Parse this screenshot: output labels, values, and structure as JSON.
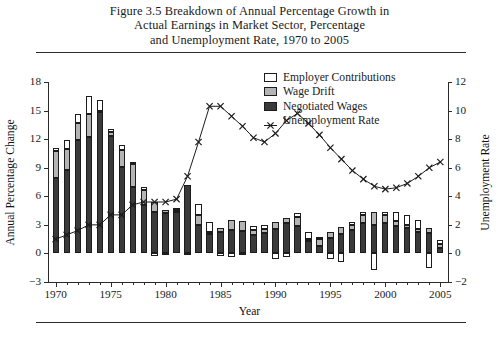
{
  "figure": {
    "caption_lines": [
      "Figure 3.5  Breakdown of Annual Percentage Growth in",
      "Actual Earnings in Market Sector, Percentage",
      "and Unemployment Rate, 1970 to 2005"
    ]
  },
  "legend": {
    "position": "top-right-inside",
    "items": [
      {
        "label": "Employer Contributions",
        "swatch": "white",
        "color": "#ffffff",
        "type": "swatch"
      },
      {
        "label": "Wage Drift",
        "swatch": "light-gray",
        "color": "#b4b4b4",
        "type": "swatch"
      },
      {
        "label": "Negotiated Wages",
        "swatch": "dark-gray",
        "color": "#3a3a3a",
        "type": "swatch"
      },
      {
        "label": "Unemployment Rate",
        "swatch": "x-marker-line",
        "color": "#1c1c1c",
        "type": "line-marker"
      }
    ]
  },
  "axes": {
    "x": {
      "title": "Year",
      "ticks": [
        1970,
        1975,
        1980,
        1985,
        1990,
        1995,
        2000,
        2005
      ],
      "tick_labels": [
        "1970",
        "1975",
        "1980",
        "1985",
        "1990",
        "1995",
        "2000",
        "2005"
      ],
      "min": 1969.3,
      "max": 2005.7
    },
    "y_left": {
      "title": "Annual Percentage Change",
      "ticks": [
        -3,
        0,
        3,
        6,
        9,
        12,
        15,
        18
      ],
      "tick_labels": [
        "−3",
        "0",
        "3",
        "6",
        "9",
        "12",
        "15",
        "18"
      ],
      "min": -3,
      "max": 18
    },
    "y_right": {
      "title": "Unemployment Rate",
      "ticks": [
        -2,
        0,
        2,
        4,
        6,
        8,
        10,
        12
      ],
      "tick_labels": [
        "−2",
        "0",
        "2",
        "4",
        "6",
        "8",
        "10",
        "12"
      ],
      "min": -2,
      "max": 12
    },
    "grid": false
  },
  "chart_data": {
    "type": "bar",
    "title": "Figure 3.5 Breakdown of Annual Percentage Growth in Actual Earnings in Market Sector, Percentage and Unemployment Rate, 1970 to 2005",
    "xlabel": "Year",
    "ylabel": "Annual Percentage Change",
    "ylabel_secondary": "Unemployment Rate",
    "ylim": [
      -3,
      18
    ],
    "ylim_secondary": [
      -2,
      12
    ],
    "stacked": true,
    "grid": false,
    "legend_position": "top-right",
    "categories": [
      1970,
      1971,
      1972,
      1973,
      1974,
      1975,
      1976,
      1977,
      1978,
      1979,
      1980,
      1981,
      1982,
      1983,
      1984,
      1985,
      1986,
      1987,
      1988,
      1989,
      1990,
      1991,
      1992,
      1993,
      1994,
      1995,
      1996,
      1997,
      1998,
      1999,
      2000,
      2001,
      2002,
      2003,
      2004,
      2005
    ],
    "series": [
      {
        "name": "Negotiated Wages",
        "color": "#3a3a3a",
        "values": [
          7.9,
          8.8,
          11.9,
          12.2,
          14.9,
          12.3,
          9.1,
          7.0,
          5.1,
          4.4,
          4.2,
          4.3,
          7.2,
          3.0,
          2.0,
          2.3,
          2.5,
          2.4,
          1.9,
          2.1,
          2.6,
          3.2,
          2.9,
          1.3,
          0.8,
          1.6,
          2.0,
          2.5,
          3.2,
          3.0,
          3.2,
          2.9,
          2.7,
          2.2,
          2.1,
          0.6
        ]
      },
      {
        "name": "Wage Drift",
        "color": "#b4b4b4",
        "values": [
          2.9,
          2.2,
          1.8,
          2.4,
          0.1,
          0.5,
          1.8,
          2.4,
          1.6,
          1.0,
          0.4,
          0.3,
          0.0,
          1.0,
          0.3,
          0.4,
          1.0,
          1.0,
          0.6,
          0.5,
          0.7,
          0.5,
          0.9,
          0.2,
          0.7,
          0.6,
          0.8,
          0.5,
          0.8,
          1.3,
          0.8,
          0.5,
          0.3,
          0.4,
          0.6,
          0.4
        ]
      },
      {
        "name": "Employer Contributions",
        "color": "#ffffff",
        "values": [
          0.3,
          0.9,
          0.9,
          1.9,
          1.1,
          0.3,
          0.5,
          0.2,
          0.3,
          -0.3,
          -0.2,
          0.2,
          -0.2,
          1.2,
          1.0,
          -0.3,
          -0.4,
          -0.2,
          0.4,
          0.4,
          -0.6,
          -0.4,
          0.4,
          0.8,
          0.2,
          -0.6,
          -0.9,
          0.3,
          0.3,
          -1.7,
          0.3,
          0.9,
          1.0,
          0.9,
          -1.5,
          0.4
        ]
      },
      {
        "name": "Unemployment Rate",
        "color": "#1c1c1c",
        "axis": "secondary",
        "type": "line",
        "marker": "x",
        "values": [
          1.0,
          1.3,
          1.6,
          2.0,
          2.0,
          2.7,
          2.7,
          3.4,
          3.6,
          3.6,
          3.6,
          3.8,
          5.4,
          7.8,
          10.3,
          10.3,
          9.6,
          8.9,
          8.1,
          7.8,
          8.4,
          9.3,
          9.8,
          9.1,
          8.3,
          7.4,
          6.6,
          5.8,
          5.2,
          4.7,
          4.5,
          4.6,
          4.9,
          5.4,
          6.0,
          6.4
        ]
      }
    ]
  }
}
